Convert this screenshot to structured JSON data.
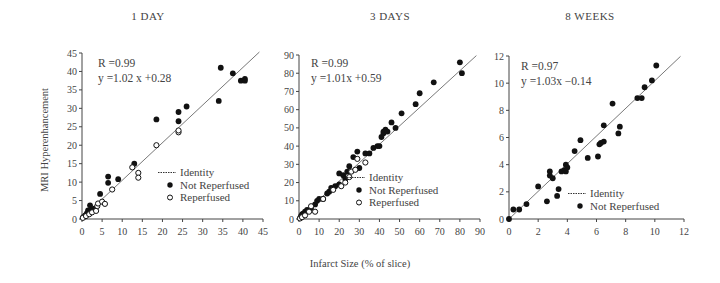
{
  "figure": {
    "y_axis_label": "MRI Hyperenhancement",
    "x_axis_label": "Infarct Size (% of slice)"
  },
  "legend": {
    "identity": "Identity",
    "not_reperfused": "Not Reperfused",
    "reperfused": "Reperfused"
  },
  "chart_data": [
    {
      "type": "scatter",
      "title": "1 DAY",
      "xlabel": "Infarct Size (% of slice)",
      "ylabel": "MRI Hyperenhancement",
      "xlim": [
        0,
        45
      ],
      "ylim": [
        0,
        45
      ],
      "xticks": [
        0,
        5,
        10,
        15,
        20,
        25,
        30,
        35,
        40,
        45
      ],
      "yticks": [
        0,
        5,
        10,
        15,
        20,
        25,
        30,
        35,
        40,
        45
      ],
      "stats": {
        "R": "R =0.99",
        "equation": "y =1.02 x +0.28"
      },
      "fit": {
        "slope": 1.02,
        "intercept": 0.28
      },
      "legend_entries": [
        "Identity",
        "Not Reperfused",
        "Reperfused"
      ],
      "series": [
        {
          "name": "Not Reperfused",
          "marker": "filled",
          "points": [
            [
              0.3,
              0.5
            ],
            [
              0.8,
              1.0
            ],
            [
              1.2,
              1.5
            ],
            [
              1.5,
              2.3
            ],
            [
              2,
              1.8
            ],
            [
              2,
              3.7
            ],
            [
              2.5,
              2.5
            ],
            [
              3,
              2.8
            ],
            [
              4.5,
              6.8
            ],
            [
              6.5,
              9.8
            ],
            [
              6.5,
              11.5
            ],
            [
              9,
              10.8
            ],
            [
              13,
              15
            ],
            [
              18.5,
              27
            ],
            [
              24,
              26.5
            ],
            [
              24,
              29
            ],
            [
              26,
              30.5
            ],
            [
              34,
              32
            ],
            [
              34.5,
              41
            ],
            [
              37.5,
              39.5
            ],
            [
              39.5,
              37.5
            ],
            [
              40.5,
              37.5
            ],
            [
              40.5,
              38
            ]
          ]
        },
        {
          "name": "Reperfused",
          "marker": "open",
          "points": [
            [
              0.2,
              0.3
            ],
            [
              1,
              0.8
            ],
            [
              1.8,
              1.3
            ],
            [
              2.5,
              1.8
            ],
            [
              3.5,
              2.2
            ],
            [
              3.8,
              3.5
            ],
            [
              4,
              4.2
            ],
            [
              5,
              4.7
            ],
            [
              5.7,
              4.1
            ],
            [
              7.5,
              8
            ],
            [
              12.5,
              14
            ],
            [
              14,
              12.5
            ],
            [
              14,
              11.2
            ],
            [
              18.5,
              20
            ],
            [
              24,
              23.5
            ],
            [
              24,
              24
            ]
          ]
        }
      ]
    },
    {
      "type": "scatter",
      "title": "3 DAYS",
      "xlabel": "Infarct Size (% of slice)",
      "ylabel": "MRI Hyperenhancement",
      "xlim": [
        0,
        90
      ],
      "ylim": [
        0,
        90
      ],
      "xticks": [
        0,
        10,
        20,
        30,
        40,
        50,
        60,
        70,
        80,
        90
      ],
      "yticks": [
        0,
        10,
        20,
        30,
        40,
        50,
        60,
        70,
        80,
        90
      ],
      "stats": {
        "R": "R =0.99",
        "equation": "y =1.01x +0.59"
      },
      "fit": {
        "slope": 1.01,
        "intercept": 0.59
      },
      "legend_entries": [
        "Identity",
        "Not Reperfused",
        "Reperfused"
      ],
      "series": [
        {
          "name": "Not Reperfused",
          "marker": "filled",
          "points": [
            [
              0.5,
              0.5
            ],
            [
              1,
              1.5
            ],
            [
              1.5,
              2.5
            ],
            [
              2,
              3
            ],
            [
              3,
              4
            ],
            [
              4,
              5
            ],
            [
              6,
              6
            ],
            [
              8,
              8
            ],
            [
              9,
              10
            ],
            [
              10,
              11
            ],
            [
              12,
              11
            ],
            [
              14,
              14
            ],
            [
              15,
              15
            ],
            [
              16,
              17
            ],
            [
              18,
              18
            ],
            [
              20,
              19
            ],
            [
              20,
              25
            ],
            [
              22,
              24
            ],
            [
              23,
              22
            ],
            [
              24,
              26
            ],
            [
              25,
              29
            ],
            [
              27,
              34
            ],
            [
              29,
              37
            ],
            [
              30,
              28
            ],
            [
              33,
              36
            ],
            [
              35,
              36
            ],
            [
              37,
              39
            ],
            [
              39,
              40
            ],
            [
              40,
              40
            ],
            [
              41,
              45
            ],
            [
              42,
              47
            ],
            [
              42,
              48
            ],
            [
              43,
              49
            ],
            [
              44,
              48
            ],
            [
              46,
              53
            ],
            [
              48,
              50
            ],
            [
              51,
              58
            ],
            [
              58,
              63
            ],
            [
              60,
              69
            ],
            [
              67,
              75
            ],
            [
              80,
              86
            ],
            [
              81,
              80
            ]
          ]
        },
        {
          "name": "Reperfused",
          "marker": "open",
          "points": [
            [
              0.5,
              0.3
            ],
            [
              1.5,
              1
            ],
            [
              3,
              2
            ],
            [
              5,
              4
            ],
            [
              6,
              7
            ],
            [
              8,
              4
            ],
            [
              12,
              11
            ],
            [
              17,
              16
            ],
            [
              21,
              18
            ],
            [
              23,
              20
            ],
            [
              25,
              23
            ],
            [
              26,
              26
            ],
            [
              28,
              27
            ],
            [
              29,
              33
            ],
            [
              33,
              31
            ]
          ]
        }
      ]
    },
    {
      "type": "scatter",
      "title": "8 WEEKS",
      "xlabel": "Infarct Size (% of slice)",
      "ylabel": "MRI Hyperenhancement",
      "xlim": [
        0,
        12
      ],
      "ylim": [
        0,
        12
      ],
      "xticks": [
        0,
        2,
        4,
        6,
        8,
        10,
        12
      ],
      "yticks": [
        0,
        2,
        4,
        6,
        8,
        10,
        12
      ],
      "stats": {
        "R": "R =0.97",
        "equation": "y =1.03x −0.14"
      },
      "fit": {
        "slope": 1.03,
        "intercept": -0.14
      },
      "legend_entries": [
        "Identity",
        "Not Reperfused"
      ],
      "series": [
        {
          "name": "Not Reperfused",
          "marker": "filled",
          "points": [
            [
              0,
              0
            ],
            [
              0.3,
              0.7
            ],
            [
              0.7,
              0.7
            ],
            [
              1.2,
              1.1
            ],
            [
              2,
              2.4
            ],
            [
              2.6,
              1.3
            ],
            [
              2.8,
              3.5
            ],
            [
              2.8,
              3.2
            ],
            [
              3,
              3
            ],
            [
              3.3,
              1.7
            ],
            [
              3.4,
              2.2
            ],
            [
              3.6,
              3.5
            ],
            [
              3.8,
              3.6
            ],
            [
              3.9,
              3.5
            ],
            [
              3.9,
              4
            ],
            [
              4,
              3.8
            ],
            [
              4.5,
              5
            ],
            [
              4.9,
              5.8
            ],
            [
              5.4,
              4.5
            ],
            [
              6.1,
              4.6
            ],
            [
              6.2,
              5.5
            ],
            [
              6.3,
              5.6
            ],
            [
              6.5,
              5.7
            ],
            [
              6.5,
              6.9
            ],
            [
              7.1,
              8.5
            ],
            [
              7.5,
              6.3
            ],
            [
              7.6,
              6.8
            ],
            [
              8.8,
              8.9
            ],
            [
              9.1,
              8.9
            ],
            [
              9.3,
              9.7
            ],
            [
              9.8,
              10.2
            ],
            [
              10.1,
              11.3
            ]
          ]
        }
      ]
    }
  ]
}
